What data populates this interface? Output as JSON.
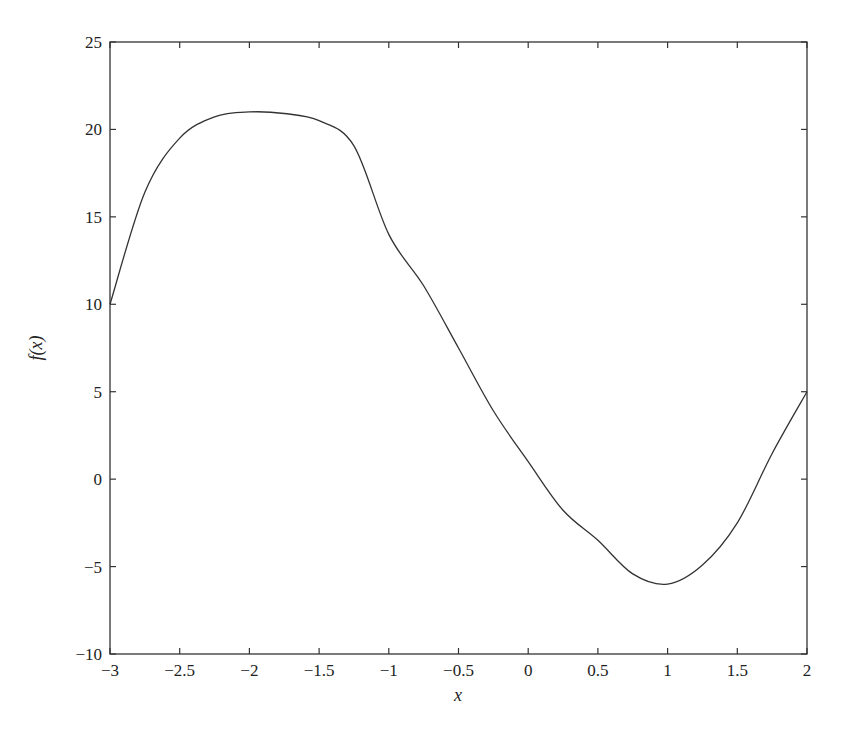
{
  "chart_data": {
    "type": "line",
    "title": "",
    "xlabel": "x",
    "ylabel": "f(x)",
    "xlim": [
      -3,
      2
    ],
    "ylim": [
      -10,
      25
    ],
    "xticks": [
      -3,
      -2.5,
      -2,
      -1.5,
      -1,
      -0.5,
      0,
      0.5,
      1,
      1.5,
      2
    ],
    "xtick_labels": [
      "−3",
      "−2.5",
      "−2",
      "−1.5",
      "−1",
      "−0.5",
      "0",
      "0.5",
      "1",
      "1.5",
      "2"
    ],
    "yticks": [
      -10,
      -5,
      0,
      5,
      10,
      15,
      20,
      25
    ],
    "ytick_labels": [
      "−10",
      "−5",
      "0",
      "5",
      "10",
      "15",
      "20",
      "25"
    ],
    "grid": false,
    "legend": null,
    "line_color": "#333333",
    "series": [
      {
        "name": "f(x)",
        "x": [
          -3,
          -2.75,
          -2.5,
          -2.25,
          -2,
          -1.75,
          -1.5,
          -1.25,
          -1,
          -0.75,
          -0.5,
          -0.25,
          0,
          0.25,
          0.5,
          0.75,
          1,
          1.25,
          1.5,
          1.75,
          2
        ],
        "values": [
          10,
          16.41,
          19.5,
          20.72,
          21,
          20.91,
          20.5,
          19.06,
          14,
          11.06,
          7.5,
          3.91,
          1,
          -1.78,
          -3.5,
          -5.42,
          -6,
          -4.91,
          -2.5,
          1.47,
          5
        ]
      }
    ]
  }
}
